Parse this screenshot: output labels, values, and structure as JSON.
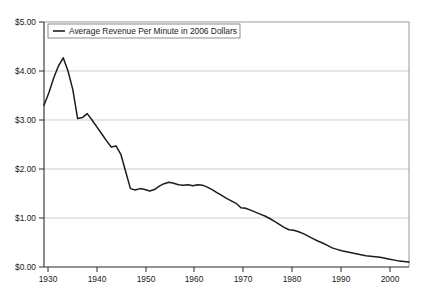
{
  "chart_data": {
    "type": "line",
    "title": "",
    "xlabel": "",
    "ylabel": "",
    "xlim": [
      1930,
      2006
    ],
    "ylim": [
      0,
      5
    ],
    "grid": true,
    "legend_position": "top-left",
    "y_tick_labels": [
      "$0.00",
      "$1.00",
      "$2.00",
      "$3.00",
      "$4.00",
      "$5.00"
    ],
    "y_tick_values": [
      0,
      1,
      2,
      3,
      4,
      5
    ],
    "x_tick_labels": [
      "1930",
      "1940",
      "1950",
      "1960",
      "1970",
      "1980",
      "1990",
      "2000"
    ],
    "x_tick_values": [
      1930,
      1940,
      1950,
      1960,
      1970,
      1980,
      1990,
      2000
    ],
    "series": [
      {
        "name": "Average Revenue Per Minute in 2006 Dollars",
        "color": "#1c1c1c",
        "x": [
          1930,
          1931,
          1932,
          1933,
          1934,
          1935,
          1936,
          1937,
          1938,
          1939,
          1940,
          1941,
          1942,
          1943,
          1944,
          1945,
          1946,
          1947,
          1948,
          1949,
          1950,
          1951,
          1952,
          1953,
          1954,
          1955,
          1956,
          1957,
          1958,
          1959,
          1960,
          1961,
          1962,
          1963,
          1964,
          1965,
          1966,
          1967,
          1968,
          1969,
          1970,
          1971,
          1972,
          1973,
          1974,
          1975,
          1976,
          1977,
          1978,
          1979,
          1980,
          1981,
          1982,
          1983,
          1984,
          1985,
          1986,
          1987,
          1988,
          1989,
          1990,
          1991,
          1992,
          1993,
          1994,
          1995,
          1996,
          1997,
          1998,
          1999,
          2000,
          2001,
          2002,
          2003,
          2004,
          2005,
          2006
        ],
        "values": [
          3.3,
          3.55,
          3.85,
          4.1,
          4.27,
          4.0,
          3.62,
          3.03,
          3.05,
          3.13,
          3.0,
          2.86,
          2.72,
          2.58,
          2.45,
          2.47,
          2.3,
          1.95,
          1.6,
          1.57,
          1.6,
          1.58,
          1.55,
          1.58,
          1.65,
          1.7,
          1.73,
          1.71,
          1.68,
          1.67,
          1.68,
          1.66,
          1.68,
          1.67,
          1.63,
          1.58,
          1.52,
          1.46,
          1.4,
          1.35,
          1.3,
          1.21,
          1.2,
          1.16,
          1.12,
          1.08,
          1.04,
          0.99,
          0.93,
          0.87,
          0.81,
          0.76,
          0.75,
          0.72,
          0.68,
          0.63,
          0.58,
          0.53,
          0.49,
          0.44,
          0.39,
          0.36,
          0.33,
          0.31,
          0.29,
          0.27,
          0.25,
          0.23,
          0.22,
          0.21,
          0.2,
          0.18,
          0.16,
          0.14,
          0.12,
          0.11,
          0.1
        ]
      }
    ],
    "legend": [
      "Average Revenue Per Minute in 2006 Dollars"
    ]
  },
  "legend": {
    "label": "Average Revenue Per Minute in 2006 Dollars"
  },
  "axes": {
    "y_labels": [
      "$5.00",
      "$4.00",
      "$3.00",
      "$2.00",
      "$1.00",
      "$0.00"
    ],
    "x_labels": [
      "1930",
      "1940",
      "1950",
      "1960",
      "1970",
      "1980",
      "1990",
      "2000"
    ]
  }
}
